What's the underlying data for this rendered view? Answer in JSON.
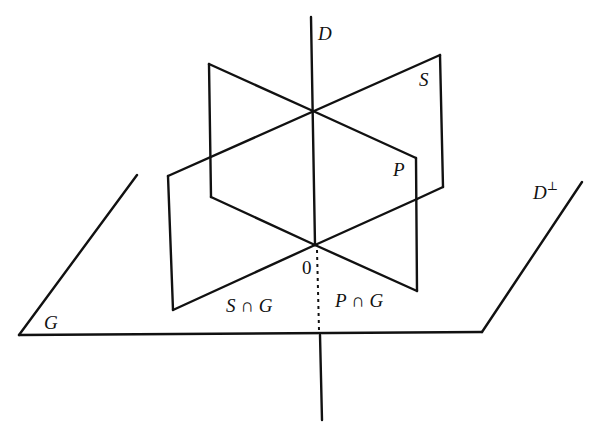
{
  "figure": {
    "stroke_color": "#111111",
    "background": "#ffffff"
  },
  "labels": {
    "D": "D",
    "S": "S",
    "P": "P",
    "D_perp_base": "D",
    "D_perp_sup": "⊥",
    "origin": "0",
    "G": "G",
    "S_cap_G": "S ∩ G",
    "P_cap_G": "P ∩ G"
  },
  "geometry": {
    "line_D": {
      "top": [
        311,
        17
      ],
      "bottom": [
        322,
        420
      ]
    },
    "origin": [
      315,
      245
    ],
    "axis_point": [
      313,
      111
    ],
    "plane_S": [
      [
        168,
        176
      ],
      [
        440,
        55
      ],
      [
        443,
        187
      ],
      [
        173,
        310
      ]
    ],
    "plane_P": [
      [
        209,
        64
      ],
      [
        416,
        158
      ],
      [
        417,
        291
      ],
      [
        211,
        197
      ]
    ],
    "plane_G": {
      "front_y": 334,
      "left_edge": [
        [
          137,
          175
        ],
        [
          19,
          335
        ]
      ],
      "right_edge": [
        [
          582,
          182
        ],
        [
          482,
          332
        ]
      ]
    }
  }
}
